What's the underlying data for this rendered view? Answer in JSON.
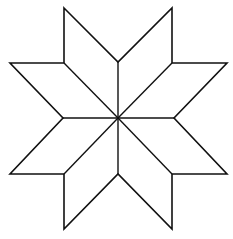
{
  "figure": {
    "description": "Eight-pointed star composed of eight rhombi meeting at a central point",
    "colors": {
      "background": "#ffffff",
      "stroke": "#111111"
    },
    "center": [
      118,
      118
    ],
    "outline_points": [
      [
        64,
        8
      ],
      [
        118,
        62
      ],
      [
        172,
        8
      ],
      [
        172,
        63
      ],
      [
        227,
        63
      ],
      [
        174,
        118
      ],
      [
        227,
        174
      ],
      [
        172,
        174
      ],
      [
        172,
        229
      ],
      [
        118,
        174
      ],
      [
        64,
        229
      ],
      [
        64,
        174
      ],
      [
        10,
        174
      ],
      [
        63,
        118
      ],
      [
        10,
        63
      ],
      [
        64,
        63
      ]
    ],
    "spoke_points": [
      [
        118,
        62
      ],
      [
        172,
        63
      ],
      [
        174,
        118
      ],
      [
        172,
        174
      ],
      [
        118,
        174
      ],
      [
        64,
        174
      ],
      [
        63,
        118
      ],
      [
        64,
        63
      ]
    ],
    "rhombus_count": 8
  }
}
